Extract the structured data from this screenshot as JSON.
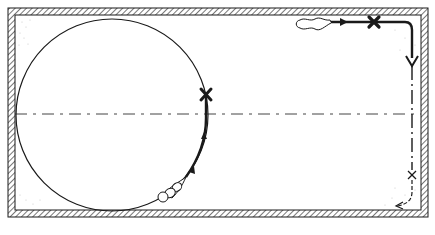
{
  "figure": {
    "type": "trajectory-diagram",
    "colors": {
      "ink": "#1a1a1a",
      "hatch": "#555555",
      "background": "#ffffff",
      "faint_caption": "#bbbbbb"
    },
    "frame": {
      "x": 8,
      "y": 8,
      "width": 420,
      "height": 209,
      "border_thickness": 7
    },
    "centerline": {
      "y": 114,
      "style": "dashed"
    },
    "left_panel": {
      "circle": {
        "cx": 112,
        "cy": 115,
        "r": 96
      },
      "marker": {
        "label": "X",
        "x": 206,
        "y": 95
      },
      "object_label": "particle-trail"
    },
    "right_panel": {
      "start_marker": {
        "label": "X",
        "x": 374,
        "y": 22
      },
      "end_marker": {
        "label": "x",
        "x": 412,
        "y": 175
      },
      "object_label": "particle-trail"
    },
    "caption": ""
  }
}
